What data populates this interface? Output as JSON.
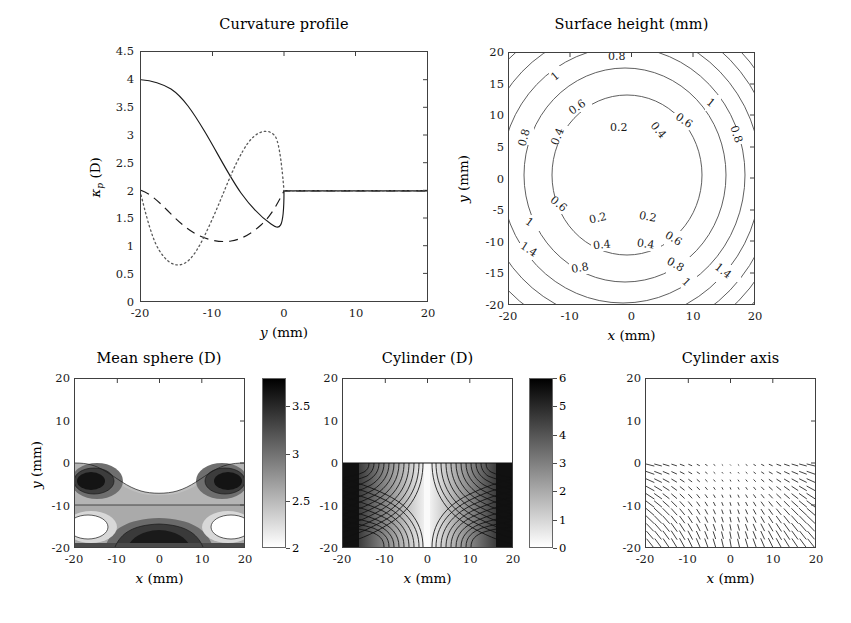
{
  "figure": {
    "width": 851,
    "height": 623,
    "background": "#ffffff"
  },
  "panels": {
    "curvature": {
      "title": "Curvature profile",
      "xlabel": "y (mm)",
      "ylabel": "κ_p (D)",
      "xticks": [
        "-20",
        "-10",
        "0",
        "10",
        "20"
      ],
      "yticks": [
        "0",
        "0.5",
        "1",
        "1.5",
        "2",
        "2.5",
        "3",
        "3.5",
        "4",
        "4.5"
      ]
    },
    "surface": {
      "title": "Surface height (mm)",
      "xlabel": "x (mm)",
      "ylabel": "y (mm)",
      "xticks": [
        "-20",
        "-10",
        "0",
        "10",
        "20"
      ],
      "yticks": [
        "-20",
        "-15",
        "-10",
        "-5",
        "0",
        "5",
        "10",
        "15",
        "20"
      ],
      "contour_labels": [
        "0.2",
        "0.4",
        "0.6",
        "0.8",
        "1",
        "1.4"
      ]
    },
    "meansphere": {
      "title": "Mean sphere (D)",
      "xlabel": "x (mm)",
      "ylabel": "y (mm)",
      "xticks": [
        "-20",
        "-10",
        "0",
        "10",
        "20"
      ],
      "yticks": [
        "-20",
        "-10",
        "0",
        "10",
        "20"
      ],
      "cbar_ticks": [
        "2",
        "2.5",
        "3",
        "3.5"
      ]
    },
    "cylinder": {
      "title": "Cylinder (D)",
      "xlabel": "x (mm)",
      "ylabel": "y (mm)",
      "xticks": [
        "-20",
        "-10",
        "0",
        "10",
        "20"
      ],
      "yticks": [
        "-20",
        "-10",
        "0",
        "10",
        "20"
      ],
      "cbar_ticks": [
        "0",
        "1",
        "2",
        "3",
        "4",
        "5",
        "6"
      ]
    },
    "cylaxis": {
      "title": "Cylinder axis",
      "xlabel": "x (mm)",
      "ylabel": "",
      "xticks": [
        "-20",
        "-10",
        "0",
        "10",
        "20"
      ],
      "yticks": [
        "-20",
        "-10",
        "0",
        "10",
        "20"
      ]
    }
  },
  "chart_data": [
    {
      "id": "curvature-profile",
      "type": "line",
      "title": "Curvature profile",
      "xlabel": "y (mm)",
      "ylabel": "κ_p (D)",
      "xlim": [
        -20,
        20
      ],
      "ylim": [
        0,
        4.5
      ],
      "xticks": [
        -20,
        -10,
        0,
        10,
        20
      ],
      "yticks": [
        0,
        0.5,
        1,
        1.5,
        2,
        2.5,
        3,
        3.5,
        4,
        4.5
      ],
      "grid": false,
      "legend": "none",
      "series": [
        {
          "name": "solid",
          "style": "solid",
          "color": "#1a1a1a",
          "x": [
            -20,
            -19,
            -18,
            -17,
            -16,
            -15,
            -14,
            -13,
            -12,
            -11,
            -10,
            -9,
            -8,
            -7,
            -6,
            -5,
            -4,
            -3,
            -2,
            -1,
            0,
            5,
            10,
            15,
            20
          ],
          "y": [
            4.0,
            3.99,
            3.96,
            3.9,
            3.82,
            3.71,
            3.58,
            3.44,
            3.28,
            3.11,
            2.94,
            2.77,
            2.61,
            2.46,
            2.33,
            2.22,
            2.13,
            2.07,
            2.03,
            2.0,
            1.98,
            1.98,
            1.98,
            1.98,
            1.98
          ]
        },
        {
          "name": "dashed",
          "style": "dashed",
          "color": "#1a1a1a",
          "x": [
            -20,
            -19,
            -18,
            -17,
            -16,
            -15,
            -14,
            -13,
            -12,
            -11,
            -10,
            -9,
            -8,
            -7,
            -6,
            -5,
            -4,
            -3,
            -2,
            -1,
            0,
            5,
            10,
            15,
            20
          ],
          "y": [
            2.0,
            1.96,
            1.88,
            1.78,
            1.66,
            1.54,
            1.44,
            1.35,
            1.29,
            1.25,
            1.24,
            1.26,
            1.31,
            1.39,
            1.49,
            1.6,
            1.71,
            1.82,
            1.9,
            1.96,
            1.98,
            1.98,
            1.98,
            1.98,
            1.98
          ]
        },
        {
          "name": "dotted",
          "style": "dotted",
          "color": "#555555",
          "x": [
            -20,
            -19,
            -18,
            -17,
            -16,
            -15,
            -14,
            -13,
            -12,
            -11,
            -10,
            -9,
            -8,
            -7,
            -6,
            -5,
            -4,
            -3,
            -2,
            -1,
            0,
            5,
            10,
            15,
            20
          ],
          "y": [
            1.9,
            1.42,
            1.1,
            0.92,
            0.86,
            0.92,
            1.08,
            1.33,
            1.64,
            1.98,
            2.32,
            2.63,
            2.88,
            3.05,
            3.13,
            3.13,
            3.1,
            2.95,
            2.6,
            2.2,
            1.98,
            1.98,
            1.98,
            1.98,
            1.98
          ]
        }
      ]
    },
    {
      "id": "surface-height",
      "type": "contour",
      "title": "Surface height (mm)",
      "xlabel": "x (mm)",
      "ylabel": "y (mm)",
      "xlim": [
        -20,
        20
      ],
      "ylim": [
        -20,
        20
      ],
      "levels": [
        0.2,
        0.4,
        0.6,
        0.8,
        1.0,
        1.2,
        1.4,
        1.6
      ],
      "labeled_levels": [
        "0.2",
        "0.4",
        "0.6",
        "0.8",
        "1",
        "1.4"
      ],
      "description": "Concentric roughly-circular contours centred near (0,0), increasing outward"
    },
    {
      "id": "mean-sphere",
      "type": "contourf",
      "title": "Mean sphere (D)",
      "xlabel": "x (mm)",
      "ylabel": "y (mm)",
      "xlim": [
        -20,
        20
      ],
      "ylim": [
        -20,
        20
      ],
      "clim": [
        2,
        3.8
      ],
      "cbar_ticks": [
        2,
        2.5,
        3,
        3.5
      ],
      "description": "Uniform 2 D above y=0; dark lobes near (+/-17,-5) and dark band near y=-19"
    },
    {
      "id": "cylinder",
      "type": "contourf",
      "title": "Cylinder (D)",
      "xlabel": "x (mm)",
      "ylabel": "y (mm)",
      "xlim": [
        -20,
        20
      ],
      "ylim": [
        -20,
        20
      ],
      "clim": [
        0,
        6
      ],
      "cbar_ticks": [
        0,
        1,
        2,
        3,
        4,
        5,
        6
      ],
      "description": "Zero above y=0; two dark lobed regions with dense contours below y=0"
    },
    {
      "id": "cylinder-axis",
      "type": "quiver",
      "title": "Cylinder axis",
      "xlabel": "x (mm)",
      "ylabel": "",
      "xlim": [
        -20,
        20
      ],
      "ylim": [
        -20,
        20
      ],
      "description": "Vector field of short line segments below y=0; length grows toward lower-left and lower-right corners"
    }
  ]
}
